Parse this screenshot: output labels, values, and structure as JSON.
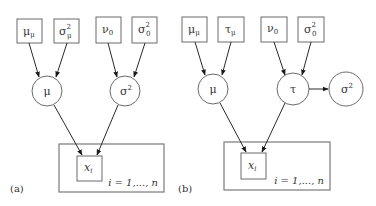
{
  "figure": {
    "panels": [
      {
        "id": "a",
        "label": "(a)",
        "hyperparameters": [
          {
            "base": "μ",
            "sub": "μ",
            "sup": ""
          },
          {
            "base": "σ",
            "sub": "μ",
            "sup": "2"
          },
          {
            "base": "ν",
            "sub": "0",
            "sup": ""
          },
          {
            "base": "σ",
            "sub": "0",
            "sup": "2"
          }
        ],
        "parameters": [
          {
            "base": "μ",
            "sup": ""
          },
          {
            "base": "σ",
            "sup": "2"
          }
        ],
        "observed": {
          "base": "x",
          "sub": "i"
        },
        "plate_label": "i = 1,..., n"
      },
      {
        "id": "b",
        "label": "(b)",
        "hyperparameters": [
          {
            "base": "μ",
            "sub": "μ",
            "sup": ""
          },
          {
            "base": "τ",
            "sub": "μ",
            "sup": ""
          },
          {
            "base": "ν",
            "sub": "0",
            "sup": ""
          },
          {
            "base": "σ",
            "sub": "0",
            "sup": "2"
          }
        ],
        "parameters": [
          {
            "base": "μ",
            "sup": ""
          },
          {
            "base": "τ",
            "sup": ""
          },
          {
            "base": "σ",
            "sup": "2"
          }
        ],
        "observed": {
          "base": "x",
          "sub": "i"
        },
        "plate_label": "i = 1,..., n"
      }
    ],
    "edges_a": [
      "μ_μ → μ",
      "σ²_μ → μ",
      "ν_0 → σ²",
      "σ²_0 → σ²",
      "μ → x_i",
      "σ² → x_i"
    ],
    "edges_b": [
      "μ_μ → μ",
      "τ_μ → μ",
      "ν_0 → τ",
      "σ²_0 → τ",
      "τ → σ²",
      "μ → x_i",
      "τ → x_i"
    ]
  }
}
